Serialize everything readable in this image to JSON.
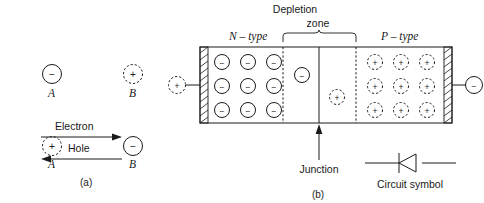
{
  "figure": {
    "caption_a": "(a)",
    "caption_b": "(b)"
  },
  "panel_a": {
    "name": "electron-hole-movement",
    "top_row": {
      "left_particle": {
        "sign": "−",
        "style": "solid",
        "label": "A"
      },
      "right_particle": {
        "sign": "+",
        "style": "dashed",
        "label": "B"
      }
    },
    "bottom_row": {
      "left_particle": {
        "sign": "+",
        "style": "dashed",
        "label": "A"
      },
      "right_particle": {
        "sign": "−",
        "style": "solid",
        "label": "B"
      }
    },
    "arrows": [
      {
        "label": "Electron",
        "direction": "right"
      },
      {
        "label": "Hole",
        "direction": "left"
      }
    ]
  },
  "panel_b": {
    "name": "pn-junction-diode",
    "region_labels": {
      "n_type": "N – type",
      "p_type": "P – type",
      "depletion_line1": "Depletion",
      "depletion_line2": "zone"
    },
    "junction_label": "Junction",
    "circuit_symbol_label": "Circuit symbol",
    "terminals": {
      "left": {
        "sign": "+",
        "style": "dashed"
      },
      "right": {
        "sign": "−",
        "style": "solid"
      }
    },
    "n_region_carriers": {
      "sign": "−",
      "style": "solid",
      "rows": 3,
      "cols": 3
    },
    "p_region_carriers": {
      "sign": "+",
      "style": "dashed",
      "rows": 3,
      "cols": 3
    },
    "depletion_carriers": [
      {
        "sign": "−",
        "style": "solid",
        "side": "n"
      },
      {
        "sign": "+",
        "style": "dashed",
        "side": "p"
      }
    ]
  },
  "colors": {
    "ink": "#1a1a1a",
    "background": "#ffffff"
  }
}
